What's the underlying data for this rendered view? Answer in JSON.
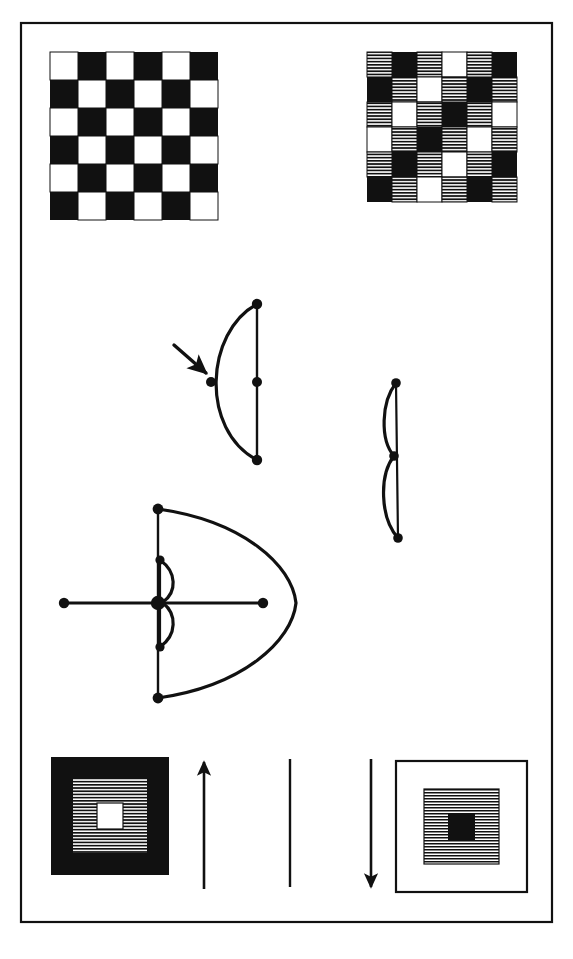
{
  "figure": {
    "background_color": "#ffffff",
    "ink_color": "#111111",
    "frame": {
      "name": "outer-frame",
      "x": 21,
      "y": 23,
      "width": 531,
      "height": 899,
      "stroke_width": 2.2,
      "stroke": "#111111",
      "fill": "none"
    },
    "checkerboards": [
      {
        "name": "checkerboard-plain",
        "x": 50,
        "y": 52,
        "cell": 28,
        "rows": 6,
        "cols": 6,
        "legend": {
          "W": "white",
          "K": "black",
          "H": "hatched"
        },
        "pattern": [
          [
            "W",
            "K",
            "W",
            "K",
            "W",
            "K"
          ],
          [
            "K",
            "W",
            "K",
            "W",
            "K",
            "W"
          ],
          [
            "W",
            "K",
            "W",
            "K",
            "W",
            "K"
          ],
          [
            "K",
            "W",
            "K",
            "W",
            "K",
            "W"
          ],
          [
            "W",
            "K",
            "W",
            "K",
            "W",
            "K"
          ],
          [
            "K",
            "W",
            "K",
            "W",
            "K",
            "W"
          ]
        ]
      },
      {
        "name": "checkerboard-hatched",
        "x": 367,
        "y": 52,
        "cell": 25,
        "rows": 6,
        "cols": 6,
        "legend": {
          "W": "white",
          "K": "black",
          "H": "hatched"
        },
        "pattern": [
          [
            "H",
            "K",
            "H",
            "W",
            "H",
            "K"
          ],
          [
            "K",
            "H",
            "W",
            "H",
            "K",
            "H"
          ],
          [
            "H",
            "W",
            "H",
            "K",
            "H",
            "W"
          ],
          [
            "W",
            "H",
            "K",
            "H",
            "W",
            "H"
          ],
          [
            "H",
            "K",
            "H",
            "W",
            "H",
            "K"
          ],
          [
            "K",
            "H",
            "W",
            "H",
            "K",
            "H"
          ]
        ]
      }
    ],
    "bows": [
      {
        "name": "bow-small-left",
        "description": "arc bulging left with vertical chord on right, arrow pointing to arc midpoint",
        "top": [
          257,
          304
        ],
        "bottom": [
          257,
          460
        ],
        "chord_mid": [
          257,
          382
        ],
        "arc_mid": [
          212,
          382
        ],
        "nodes": 4
      },
      {
        "name": "bow-narrow-right",
        "description": "narrow double bow, two small arcs stacked along a vertical line",
        "top": [
          396,
          383
        ],
        "middle": [
          394,
          456
        ],
        "bottom": [
          398,
          538
        ],
        "bulge": 12,
        "nodes": 3
      },
      {
        "name": "bow-large",
        "description": "large arc bulging right with vertical chord on left, inner small double bow, horizontal axis line",
        "top": [
          158,
          509
        ],
        "bottom": [
          158,
          698
        ],
        "center": [
          158,
          603
        ],
        "apex": [
          296,
          603
        ],
        "axis_left": [
          64,
          603
        ],
        "axis_right": [
          263,
          603
        ],
        "inner_top": [
          160,
          560
        ],
        "inner_bottom": [
          160,
          647
        ],
        "nodes": 7
      }
    ],
    "nested_squares": [
      {
        "name": "nested-square-dark",
        "x": 51,
        "y": 757,
        "size": 118,
        "outer_fill": "black",
        "middle_fill": "hatched",
        "inner_fill": "white",
        "outer_stroke": "none",
        "middle_inset": 22,
        "inner_inset": 46
      },
      {
        "name": "nested-square-light",
        "x": 396,
        "y": 761,
        "size": 131,
        "outer_fill": "white",
        "middle_fill": "hatched",
        "inner_fill": "black",
        "outer_stroke": "#111111",
        "middle_inset": 28,
        "inner_inset": 52
      }
    ],
    "arrows": [
      {
        "name": "arrow-pointer-to-arc",
        "direction": "down-right",
        "x1": 174,
        "y1": 345,
        "x2": 209,
        "y2": 375,
        "head": true,
        "tail_head": false
      },
      {
        "name": "arrow-up",
        "direction": "up",
        "x1": 204,
        "y1": 889,
        "x2": 204,
        "y2": 760,
        "head": true,
        "tail_head": false
      },
      {
        "name": "line-plain-vertical",
        "direction": "none",
        "x1": 290,
        "y1": 887,
        "x2": 290,
        "y2": 759,
        "head": false,
        "tail_head": false
      },
      {
        "name": "arrow-down",
        "direction": "down",
        "x1": 371,
        "y1": 759,
        "x2": 371,
        "y2": 889,
        "head": true,
        "tail_head": false
      }
    ]
  }
}
